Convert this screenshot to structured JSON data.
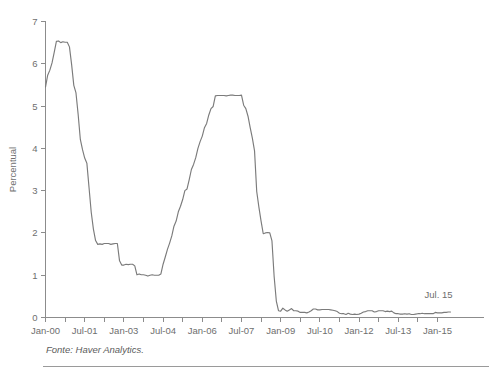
{
  "figure": {
    "top_cut_text": "",
    "source_note": "Fonte: Haver Analytics.",
    "annotation": "Jul. 15"
  },
  "chart_data": {
    "type": "line",
    "title": "",
    "xlabel": "",
    "ylabel": "Percentual",
    "ylim": [
      0,
      7
    ],
    "ytick_labels": [
      "0",
      "1",
      "2",
      "3",
      "4",
      "5",
      "6",
      "7"
    ],
    "ytick_values": [
      0,
      1,
      2,
      3,
      4,
      5,
      6,
      7
    ],
    "grid": false,
    "legend": null,
    "xlim": [
      "Jan-00",
      "Jul-15"
    ],
    "xtick_labels": [
      "Jan-00",
      "Jul-01",
      "Jan-03",
      "Jul-04",
      "Jan-06",
      "Jul-07",
      "Jan-09",
      "Jul-10",
      "Jan-12",
      "Jul-13",
      "Jan-15"
    ],
    "xtick_interval_months": 18,
    "minor_tick_interval_months": 9,
    "annotations": [
      {
        "text": "Jul. 15",
        "x": "Jul-15",
        "y": 0.15
      }
    ],
    "series": [
      {
        "name": "Fed Funds Rate",
        "color": "#7b7b7b",
        "x": [
          "2000-01",
          "2000-02",
          "2000-03",
          "2000-04",
          "2000-05",
          "2000-06",
          "2000-07",
          "2000-08",
          "2000-09",
          "2000-10",
          "2000-11",
          "2000-12",
          "2001-01",
          "2001-02",
          "2001-03",
          "2001-04",
          "2001-05",
          "2001-06",
          "2001-07",
          "2001-08",
          "2001-09",
          "2001-10",
          "2001-11",
          "2001-12",
          "2002-01",
          "2002-02",
          "2002-03",
          "2002-04",
          "2002-05",
          "2002-06",
          "2002-07",
          "2002-08",
          "2002-09",
          "2002-10",
          "2002-11",
          "2002-12",
          "2003-01",
          "2003-02",
          "2003-03",
          "2003-04",
          "2003-05",
          "2003-06",
          "2003-07",
          "2003-08",
          "2003-09",
          "2003-10",
          "2003-11",
          "2003-12",
          "2004-01",
          "2004-02",
          "2004-03",
          "2004-04",
          "2004-05",
          "2004-06",
          "2004-07",
          "2004-08",
          "2004-09",
          "2004-10",
          "2004-11",
          "2004-12",
          "2005-01",
          "2005-02",
          "2005-03",
          "2005-04",
          "2005-05",
          "2005-06",
          "2005-07",
          "2005-08",
          "2005-09",
          "2005-10",
          "2005-11",
          "2005-12",
          "2006-01",
          "2006-02",
          "2006-03",
          "2006-04",
          "2006-05",
          "2006-06",
          "2006-07",
          "2006-08",
          "2006-09",
          "2006-10",
          "2006-11",
          "2006-12",
          "2007-01",
          "2007-02",
          "2007-03",
          "2007-04",
          "2007-05",
          "2007-06",
          "2007-07",
          "2007-08",
          "2007-09",
          "2007-10",
          "2007-11",
          "2007-12",
          "2008-01",
          "2008-02",
          "2008-03",
          "2008-04",
          "2008-05",
          "2008-06",
          "2008-07",
          "2008-08",
          "2008-09",
          "2008-10",
          "2008-11",
          "2008-12",
          "2009-01",
          "2009-02",
          "2009-03",
          "2009-04",
          "2009-05",
          "2009-06",
          "2009-07",
          "2009-08",
          "2009-09",
          "2009-10",
          "2009-11",
          "2009-12",
          "2010-01",
          "2010-02",
          "2010-03",
          "2010-04",
          "2010-05",
          "2010-06",
          "2010-07",
          "2010-08",
          "2010-09",
          "2010-10",
          "2010-11",
          "2010-12",
          "2011-01",
          "2011-02",
          "2011-03",
          "2011-04",
          "2011-05",
          "2011-06",
          "2011-07",
          "2011-08",
          "2011-09",
          "2011-10",
          "2011-11",
          "2011-12",
          "2012-01",
          "2012-02",
          "2012-03",
          "2012-04",
          "2012-05",
          "2012-06",
          "2012-07",
          "2012-08",
          "2012-09",
          "2012-10",
          "2012-11",
          "2012-12",
          "2013-01",
          "2013-02",
          "2013-03",
          "2013-04",
          "2013-05",
          "2013-06",
          "2013-07",
          "2013-08",
          "2013-09",
          "2013-10",
          "2013-11",
          "2013-12",
          "2014-01",
          "2014-02",
          "2014-03",
          "2014-04",
          "2014-05",
          "2014-06",
          "2014-07",
          "2014-08",
          "2014-09",
          "2014-10",
          "2014-11",
          "2014-12",
          "2015-01",
          "2015-02",
          "2015-03",
          "2015-04",
          "2015-05",
          "2015-06",
          "2015-07"
        ],
        "values": [
          5.45,
          5.73,
          5.85,
          6.02,
          6.27,
          6.53,
          6.54,
          6.5,
          6.52,
          6.51,
          6.51,
          6.4,
          5.98,
          5.49,
          5.31,
          4.8,
          4.21,
          3.97,
          3.77,
          3.65,
          3.07,
          2.49,
          2.09,
          1.82,
          1.73,
          1.74,
          1.73,
          1.75,
          1.75,
          1.75,
          1.73,
          1.74,
          1.75,
          1.75,
          1.34,
          1.24,
          1.24,
          1.26,
          1.25,
          1.26,
          1.26,
          1.22,
          1.01,
          1.03,
          1.01,
          1.01,
          1.0,
          0.98,
          1.0,
          1.01,
          1.0,
          1.0,
          1.0,
          1.03,
          1.26,
          1.43,
          1.61,
          1.76,
          1.93,
          2.16,
          2.28,
          2.5,
          2.63,
          2.79,
          3.0,
          3.04,
          3.26,
          3.5,
          3.62,
          3.78,
          4.0,
          4.16,
          4.29,
          4.49,
          4.59,
          4.79,
          4.94,
          4.99,
          5.24,
          5.25,
          5.25,
          5.25,
          5.25,
          5.24,
          5.25,
          5.26,
          5.26,
          5.25,
          5.25,
          5.25,
          5.26,
          5.02,
          4.94,
          4.76,
          4.49,
          4.24,
          3.94,
          2.98,
          2.61,
          2.28,
          1.98,
          2.0,
          2.01,
          2.0,
          1.81,
          0.97,
          0.39,
          0.16,
          0.15,
          0.22,
          0.18,
          0.15,
          0.18,
          0.21,
          0.16,
          0.16,
          0.15,
          0.12,
          0.12,
          0.12,
          0.11,
          0.13,
          0.16,
          0.2,
          0.2,
          0.18,
          0.18,
          0.19,
          0.19,
          0.19,
          0.19,
          0.18,
          0.17,
          0.16,
          0.14,
          0.1,
          0.09,
          0.09,
          0.07,
          0.1,
          0.08,
          0.07,
          0.08,
          0.07,
          0.08,
          0.1,
          0.13,
          0.14,
          0.16,
          0.16,
          0.16,
          0.13,
          0.14,
          0.16,
          0.16,
          0.16,
          0.14,
          0.15,
          0.14,
          0.15,
          0.11,
          0.09,
          0.09,
          0.08,
          0.08,
          0.09,
          0.08,
          0.09,
          0.07,
          0.07,
          0.08,
          0.09,
          0.09,
          0.1,
          0.09,
          0.09,
          0.09,
          0.09,
          0.09,
          0.12,
          0.11,
          0.11,
          0.11,
          0.12,
          0.12,
          0.13,
          0.13
        ]
      }
    ]
  }
}
